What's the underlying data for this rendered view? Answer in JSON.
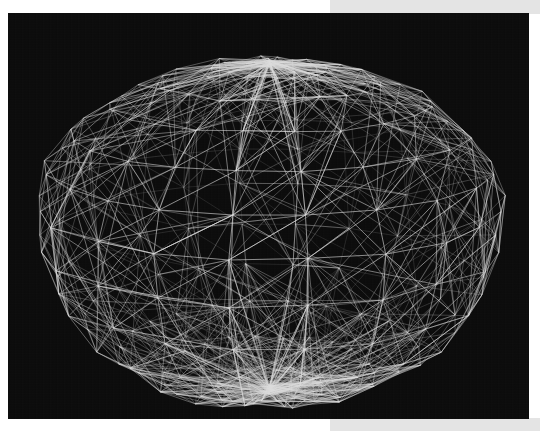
{
  "page": {
    "width": 540,
    "height": 431,
    "background_color": "#ffffff",
    "band_color": "#e4e4e4"
  },
  "viewport": {
    "name": "3d-wireframe-render",
    "x": 8,
    "y": 13,
    "width": 521,
    "height": 406,
    "background_color": "#0a0a0a",
    "edge_color": "#d8d8d8"
  },
  "chart_data": {
    "type": "scatter",
    "title": "",
    "subtitle": "",
    "xlabel": "",
    "ylabel": "",
    "render_mode": "wireframe",
    "projection": "perspective",
    "silhouette": "faceted-polygon",
    "geometry": {
      "center_x": 261,
      "center_y": 200,
      "radius_x": 235,
      "radius_y": 185,
      "latitude_bands": 13,
      "longitude_segments": 22,
      "tilt_degrees": 18,
      "squash_top": 0.82,
      "squash_bottom": 1.06
    },
    "edge_style": {
      "stroke": "#dcdcdc",
      "stroke_width_min": 0.35,
      "stroke_width_max": 0.75,
      "opacity_back": 0.3,
      "opacity_front": 0.85
    },
    "extra_chords": 1400,
    "legend": [],
    "grid": false,
    "annotations": []
  }
}
